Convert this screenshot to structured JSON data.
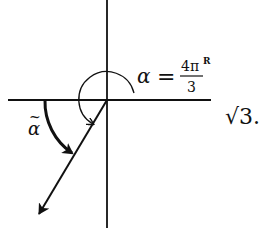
{
  "figure": {
    "type": "angle-diagram",
    "stroke_color": "#111111",
    "background": "#ffffff",
    "labels": {
      "alpha_symbol": "α",
      "equals": "=",
      "fraction_numerator": "4π",
      "fraction_superscript": "R",
      "fraction_denominator": "3",
      "alpha_tilde": "α",
      "tilde": "~",
      "trailing_text": "√3."
    },
    "annotation": "α = 4π/3 (R), with α̃ marked as the reference angle below the negative x-axis"
  }
}
